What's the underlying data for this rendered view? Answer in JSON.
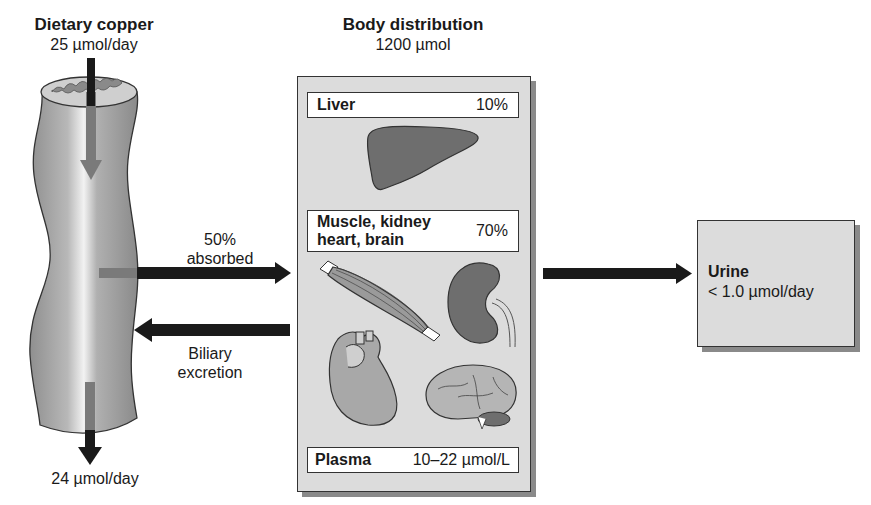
{
  "diagram": {
    "dietary": {
      "title": "Dietary copper",
      "value": "25 µmol/day"
    },
    "body": {
      "title": "Body distribution",
      "total": "1200 µmol",
      "compartments": [
        {
          "name": "Liver",
          "value": "10%"
        },
        {
          "name_line1": "Muscle, kidney",
          "name_line2": "heart, brain",
          "value": "70%"
        },
        {
          "name": "Plasma",
          "value": "10–22 µmol/L"
        }
      ]
    },
    "flows": {
      "absorbed_line1": "50%",
      "absorbed_line2": "absorbed",
      "biliary_line1": "Biliary",
      "biliary_line2": "excretion",
      "fecal": "24 µmol/day"
    },
    "urine": {
      "title": "Urine",
      "value": "< 1.0 µmol/day"
    },
    "icons": [
      "intestine-icon",
      "liver-icon",
      "muscle-icon",
      "kidney-icon",
      "heart-icon",
      "brain-icon"
    ],
    "colors": {
      "panel": "#dcdcdc",
      "organ_dark": "#6e6e6e",
      "organ_light": "#b5b5b5",
      "arrow": "#1a1a1a",
      "arrow_inner": "#7a7a7a"
    }
  }
}
